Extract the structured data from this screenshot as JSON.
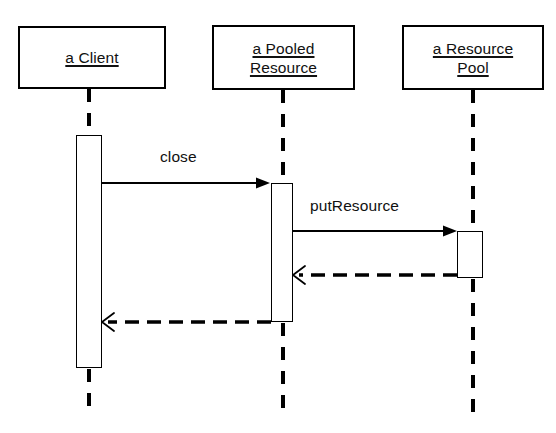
{
  "diagram": {
    "type": "uml-sequence-diagram",
    "title": "",
    "background_color": "#ffffff",
    "line_color": "#000000",
    "text_color": "#111111",
    "participants": [
      {
        "id": "client",
        "name": "a Client",
        "lines": [
          "a Client"
        ],
        "box": {
          "x": 18,
          "y": 26,
          "width": 148,
          "height": 63
        },
        "lifeline_x": 89
      },
      {
        "id": "pooled-resource",
        "name": "a Pooled Resource",
        "lines": [
          "a Pooled",
          "Resource"
        ],
        "box": {
          "x": 212,
          "y": 25,
          "width": 143,
          "height": 65
        },
        "lifeline_x": 283
      },
      {
        "id": "resource-pool",
        "name": "a Resource Pool",
        "lines": [
          "a Resource",
          "Pool"
        ],
        "box": {
          "x": 402,
          "y": 25,
          "width": 142,
          "height": 65
        },
        "lifeline_x": 473
      }
    ],
    "activations": [
      {
        "id": "activation-client",
        "participant": "client",
        "x": 76,
        "y": 135,
        "width": 26,
        "height": 233
      },
      {
        "id": "activation-pooled-resource",
        "participant": "pooled-resource",
        "x": 271,
        "y": 183,
        "width": 22,
        "height": 139
      },
      {
        "id": "activation-resource-pool",
        "participant": "resource-pool",
        "x": 457,
        "y": 231,
        "width": 26,
        "height": 47
      }
    ],
    "messages": [
      {
        "id": "message-close",
        "label": "close",
        "kind": "call",
        "style": "solid",
        "from": "client",
        "to": "pooled-resource",
        "x1": 102,
        "x2": 264,
        "y": 183,
        "label_x": 160,
        "label_y": 147
      },
      {
        "id": "message-putresource",
        "label": "putResource",
        "kind": "call",
        "style": "solid",
        "from": "pooled-resource",
        "to": "resource-pool",
        "x1": 293,
        "x2": 450,
        "y": 231,
        "label_x": 310,
        "label_y": 196
      },
      {
        "id": "message-return-resource-pool",
        "label": "",
        "kind": "return",
        "style": "dashed",
        "from": "resource-pool",
        "to": "pooled-resource",
        "x1": 457,
        "x2": 296,
        "y": 275,
        "label_x": 0,
        "label_y": 0
      },
      {
        "id": "message-return-pooled-resource",
        "label": "",
        "kind": "return",
        "style": "dashed",
        "from": "pooled-resource",
        "to": "client",
        "x1": 271,
        "x2": 105,
        "y": 322,
        "label_x": 0,
        "label_y": 0
      }
    ],
    "lifelines": [
      {
        "id": "lifeline-client-top",
        "participant": "client",
        "x": 89,
        "y1": 89,
        "y2": 135
      },
      {
        "id": "lifeline-client-bottom",
        "participant": "client",
        "x": 89,
        "y1": 368,
        "y2": 416
      },
      {
        "id": "lifeline-pooled-resource-top",
        "participant": "pooled-resource",
        "x": 283,
        "y1": 90,
        "y2": 183
      },
      {
        "id": "lifeline-pooled-resource-bottom",
        "participant": "pooled-resource",
        "x": 283,
        "y1": 322,
        "y2": 416
      },
      {
        "id": "lifeline-resource-pool-top",
        "participant": "resource-pool",
        "x": 473,
        "y1": 90,
        "y2": 231
      },
      {
        "id": "lifeline-resource-pool-bottom",
        "participant": "resource-pool",
        "x": 473,
        "y1": 278,
        "y2": 416
      }
    ]
  }
}
